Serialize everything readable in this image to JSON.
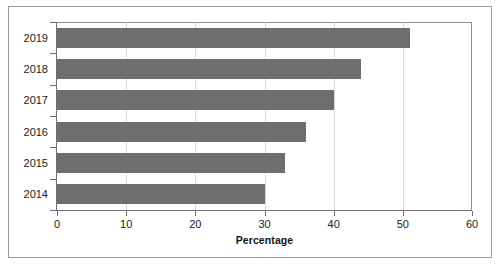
{
  "chart_data": {
    "type": "bar",
    "orientation": "horizontal",
    "title": "",
    "subtitle": "",
    "xlabel": "Percentage",
    "ylabel": "",
    "categories": [
      "2019",
      "2018",
      "2017",
      "2016",
      "2015",
      "2014"
    ],
    "values": [
      51,
      44,
      40,
      36,
      33,
      30
    ],
    "series": [
      {
        "name": "Percentage",
        "values": [
          51,
          44,
          40,
          36,
          33,
          30
        ]
      }
    ],
    "xlim": [
      0,
      60
    ],
    "xticks": [
      "0",
      "10",
      "20",
      "30",
      "40",
      "50",
      "60"
    ],
    "xtick_values": [
      0,
      10,
      20,
      30,
      40,
      50,
      60
    ],
    "grid": "vertical",
    "legend": "none",
    "bar_color": "#6e6e6e",
    "gridline_color": "#d9d9d9",
    "axis_color": "#6f6f6f",
    "frame_color": "#9a9a9a",
    "background_color": "#ffffff"
  }
}
